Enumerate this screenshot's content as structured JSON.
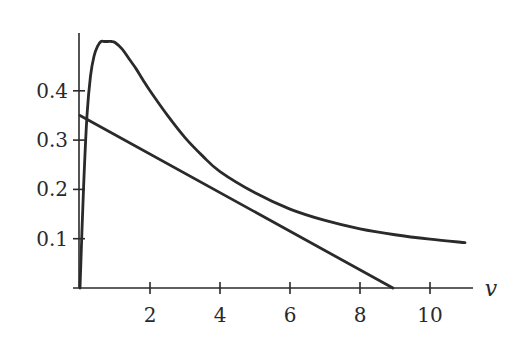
{
  "chart_data": {
    "type": "line",
    "title": "",
    "xlabel": "v",
    "ylabel": "",
    "xlim": [
      0,
      11.2
    ],
    "ylim": [
      0,
      0.51
    ],
    "grid": false,
    "legend": null,
    "x_ticks": [
      2,
      4,
      6,
      8,
      10
    ],
    "x_tick_labels": [
      "2",
      "4",
      "6",
      "8",
      "10"
    ],
    "y_ticks": [
      0.1,
      0.2,
      0.3,
      0.4
    ],
    "y_tick_labels": [
      "0.1",
      "0.2",
      "0.3",
      "0.4"
    ],
    "series": [
      {
        "name": "curve",
        "x": [
          0.0,
          0.1,
          0.2,
          0.3,
          0.4,
          0.5,
          0.6,
          0.7,
          0.8,
          0.9,
          1.0,
          1.2,
          1.4,
          1.6,
          1.8,
          2.0,
          2.5,
          3.0,
          3.5,
          4.0,
          5.0,
          6.0,
          7.0,
          8.0,
          9.0,
          10.0,
          11.0
        ],
        "y": [
          0.0,
          0.2,
          0.35,
          0.43,
          0.47,
          0.49,
          0.5,
          0.5,
          0.5,
          0.5,
          0.498,
          0.485,
          0.465,
          0.445,
          0.422,
          0.4,
          0.35,
          0.305,
          0.268,
          0.236,
          0.193,
          0.16,
          0.137,
          0.12,
          0.108,
          0.099,
          0.092
        ]
      },
      {
        "name": "line",
        "x": [
          0,
          8.94
        ],
        "y": [
          0.35,
          0.0
        ]
      }
    ]
  }
}
